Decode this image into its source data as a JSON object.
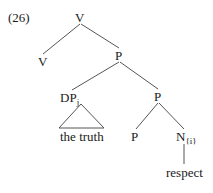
{
  "example_number": "(26)",
  "tree": {
    "root": {
      "label": "V"
    },
    "v_left": {
      "label": "V"
    },
    "p_mid": {
      "label": "P"
    },
    "dp": {
      "label": "DP",
      "subscript": "j",
      "content": "the truth"
    },
    "p_right": {
      "label": "P"
    },
    "p_low": {
      "label": "P"
    },
    "n": {
      "label": "N",
      "subscript": "{i}",
      "content": "respect"
    }
  },
  "colors": {
    "line": "#555555",
    "text": "#1a1a1a"
  }
}
